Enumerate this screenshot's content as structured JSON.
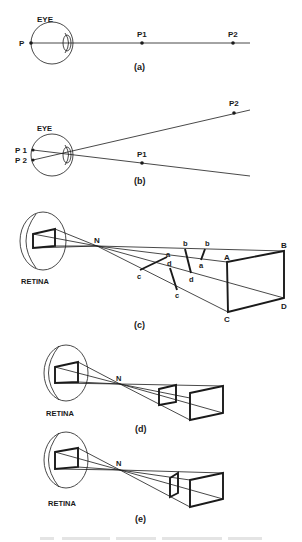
{
  "figure": {
    "panels": [
      {
        "id": "a",
        "caption": "(a)",
        "labels": {
          "eye": "EYE",
          "p": "P",
          "p1": "P1",
          "p2": "P2"
        }
      },
      {
        "id": "b",
        "caption": "(b)",
        "labels": {
          "eye": "EYE",
          "p1_retina": "P 1",
          "p2_retina": "P 2",
          "p1": "P1",
          "p2": "P2"
        }
      },
      {
        "id": "c",
        "caption": "(c)",
        "labels": {
          "retina": "RETINA",
          "nodal_point": "N",
          "A": "A",
          "B": "B",
          "C": "C",
          "D": "D",
          "a1": "a",
          "a2": "a",
          "b1": "b",
          "b2": "b",
          "c1": "c",
          "c2": "c",
          "d1": "d",
          "d2": "d"
        }
      },
      {
        "id": "d",
        "caption": "(d)",
        "labels": {
          "retina": "RETINA",
          "nodal_point": "N"
        }
      },
      {
        "id": "e",
        "caption": "(e)",
        "labels": {
          "retina": "RETINA",
          "nodal_point": "N"
        }
      }
    ],
    "colors": {
      "ink": "#1a1a1a",
      "background": "#ffffff",
      "caption_faint": "#e4e4e4"
    }
  }
}
